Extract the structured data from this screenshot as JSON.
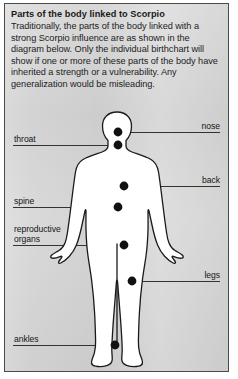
{
  "panel": {
    "title": "Parts of the body linked to Scorpio",
    "paragraph": "Traditionally, the parts of the body linked with a strong Scorpio influence are as shown in the diagram below. Only the individual birthchart will show if one or more of these parts of the body have inherited a strength or a vulnerability. Any generalization would be misleading.",
    "background_color": "#d6d6d6",
    "border_color": "#4a4a4a"
  },
  "diagram": {
    "name": "human-body-silhouette",
    "body_fill": "#ffffff",
    "body_outline": "#1a1a1a",
    "marker_color": "#111111",
    "leader_color": "#333333",
    "labels": [
      {
        "id": "nose",
        "text": "nose",
        "side": "right"
      },
      {
        "id": "throat",
        "text": "throat",
        "side": "left"
      },
      {
        "id": "back",
        "text": "back",
        "side": "right"
      },
      {
        "id": "spine",
        "text": "spine",
        "side": "left"
      },
      {
        "id": "reproductive-organs",
        "text": "reproductive\norgans",
        "side": "left"
      },
      {
        "id": "legs",
        "text": "legs",
        "side": "right"
      },
      {
        "id": "ankles",
        "text": "ankles",
        "side": "left"
      }
    ]
  }
}
